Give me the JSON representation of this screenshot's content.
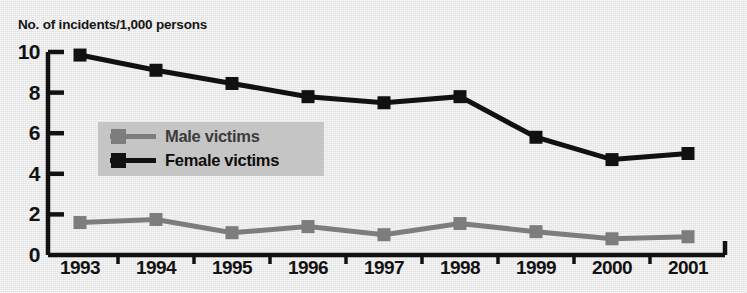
{
  "chart_data": {
    "type": "line",
    "title": "No. of incidents/1,000 persons",
    "xlabel": "",
    "ylabel": "No. of incidents/1,000 persons",
    "categories": [
      "1993",
      "1994",
      "1995",
      "1996",
      "1997",
      "1998",
      "1999",
      "2000",
      "2001"
    ],
    "x": [
      1993,
      1994,
      1995,
      1996,
      1997,
      1998,
      1999,
      2000,
      2001
    ],
    "ylim": [
      0,
      10
    ],
    "yticks": [
      0,
      2,
      4,
      6,
      8,
      10
    ],
    "ytick_labels": [
      "0",
      "2",
      "4",
      "6",
      "8",
      "10"
    ],
    "grid": false,
    "legend_position": "upper-left-inside",
    "series": [
      {
        "name": "Female victims",
        "color": "#111111",
        "marker": "square",
        "values": [
          9.85,
          9.1,
          8.45,
          7.8,
          7.5,
          7.8,
          5.8,
          4.7,
          5.0
        ]
      },
      {
        "name": "Male victims",
        "color": "#7d7d7d",
        "marker": "square",
        "values": [
          1.6,
          1.75,
          1.1,
          1.4,
          1.0,
          1.55,
          1.15,
          0.8,
          0.9
        ]
      }
    ]
  },
  "legend": {
    "items": [
      {
        "label": "Male victims",
        "color": "#7d7d7d"
      },
      {
        "label": "Female victims",
        "color": "#111111"
      }
    ]
  },
  "colors": {
    "background": "#e9e9e9",
    "axis": "#111111",
    "male": "#7d7d7d",
    "female": "#111111",
    "legend_panel": "#c5c5c5"
  }
}
